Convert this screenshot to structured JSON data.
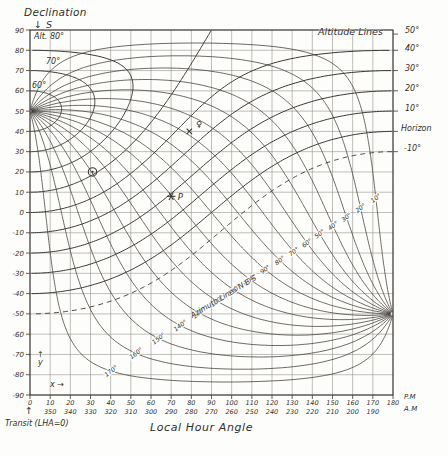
{
  "header": {
    "declination_title": "Declination",
    "south_arrow": "↓",
    "south_label": "S"
  },
  "corner_labels": {
    "altitude_lines": "Altitude Lines",
    "azimuth_lines": "Azimuth Lines N·E·S",
    "pm": "P.M",
    "am": "A.M"
  },
  "axis": {
    "x_title": "Local Hour Angle",
    "transit_label": "Transit (LHA=0)",
    "transit_arrow": "↑",
    "y_arrow": "↑",
    "y_letter": "y",
    "x_arrow_label": "x →"
  },
  "altitude_labels_left": [
    "Alt. 80°",
    "70°",
    "60°"
  ],
  "altitude_labels_right": [
    "50°",
    "40°",
    "30°",
    "20°",
    "10°",
    "Horizon",
    "-10°"
  ],
  "colors": {
    "ink": "#3c3833",
    "grid": "#8d8a84",
    "paper": "#fdfdfb"
  },
  "chart_data": {
    "type": "line",
    "xlabel": "Local Hour Angle",
    "ylabel": "Declination",
    "xlim": [
      0,
      180
    ],
    "ylim": [
      -90,
      90
    ],
    "grid": true,
    "grid_step_deg": 10,
    "latitude_deg": 50,
    "zenith": {
      "lha": 0,
      "dec": 50
    },
    "nadir": {
      "lha": 180,
      "dec": -50
    },
    "x_ticks_pm": [
      0,
      10,
      20,
      30,
      40,
      50,
      60,
      70,
      80,
      90,
      100,
      110,
      120,
      130,
      140,
      150,
      160,
      170,
      180
    ],
    "x_ticks_am": [
      350,
      340,
      330,
      320,
      310,
      300,
      290,
      280,
      270,
      260,
      250,
      240,
      230,
      220,
      210,
      200,
      190
    ],
    "y_ticks": [
      90,
      80,
      70,
      60,
      50,
      40,
      30,
      20,
      10,
      0,
      -10,
      -20,
      -30,
      -40,
      -50,
      -60,
      -70,
      -80,
      -90
    ],
    "altitude_lines_deg": [
      80,
      70,
      60,
      50,
      40,
      30,
      20,
      10,
      0,
      -10
    ],
    "dashed_altitude_deg": -10,
    "horizon_altitude_deg": 0,
    "azimuth_lines_deg": [
      10,
      20,
      30,
      40,
      50,
      60,
      70,
      80,
      90,
      100,
      110,
      120,
      130,
      140,
      150,
      160,
      170
    ],
    "azimuth_label_suffix": "°",
    "points": [
      {
        "name": "sun",
        "marker": "circled-dot",
        "label": "",
        "lha": 31,
        "dec": 20
      },
      {
        "name": "star-P",
        "marker": "six-ray-star",
        "label": "P",
        "lha": 70,
        "dec": 8
      },
      {
        "name": "venus",
        "marker": "x-cross",
        "label": "♀",
        "lha": 79,
        "dec": 40
      }
    ]
  }
}
